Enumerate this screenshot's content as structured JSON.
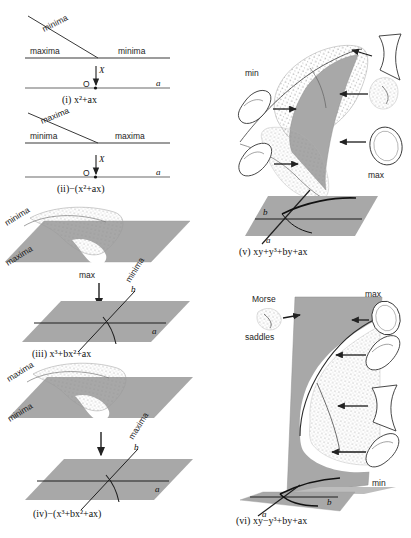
{
  "figure": {
    "panels": [
      {
        "id": "i",
        "caption": "(i) x²+ax",
        "caption_number": "(i)",
        "caption_formula": "x²+ax",
        "labels": [
          "minima",
          "maxima",
          "minima"
        ],
        "upper_diagonal_label": "minima",
        "upper_left_label": "maxima",
        "upper_right_label": "minima",
        "origin_label": "O",
        "arrow_label": "X",
        "axis_label": "a"
      },
      {
        "id": "ii",
        "caption": "(ii)−(x²+ax)",
        "caption_number": "(ii)",
        "caption_formula": "−(x²+ax)",
        "upper_diagonal_label": "maxima",
        "upper_left_label": "minima",
        "upper_right_label": "maxima",
        "origin_label": "O",
        "arrow_label": "X",
        "axis_label": "a"
      },
      {
        "id": "iii",
        "caption": "(iii) x³+bx²+ax",
        "caption_number": "(iii)",
        "caption_formula": "x³+bx²+ax",
        "sheet_labels": [
          "minima",
          "maxima",
          "minima"
        ],
        "center_label": "max",
        "axis_a": "a",
        "axis_b": "b"
      },
      {
        "id": "iv",
        "caption": "(iv)−(x³+bx²+ax)",
        "caption_number": "(iv)",
        "caption_formula": "−(x³+bx²+ax)",
        "sheet_labels": [
          "maxima",
          "minima",
          "maxima"
        ],
        "axis_a": "a",
        "axis_b": "b"
      },
      {
        "id": "v",
        "caption": "(v) xy+y³+by+ax",
        "caption_number": "(v)",
        "caption_formula": "xy+y³+by+ax",
        "label_min": "min",
        "label_max": "max",
        "axis_a": "a",
        "axis_b": "b",
        "inset_count": 6
      },
      {
        "id": "vi",
        "caption": "(vi) xy−y³+by+ax",
        "caption_number": "(vi)",
        "caption_formula": "xy−y³+by+ax",
        "label_morse": "Morse",
        "label_saddles": "saddles",
        "label_max": "max",
        "label_min": "min",
        "axis_a": "a",
        "axis_b": "b",
        "inset_count": 5
      }
    ]
  },
  "colors": {
    "plane_fill": "#a8a8a8",
    "plane_fill_light": "#bdbdbd",
    "surface_white": "#ffffff",
    "stroke": "#2b2b2b",
    "background": "#ffffff",
    "stipple": "#8c8c8c"
  }
}
